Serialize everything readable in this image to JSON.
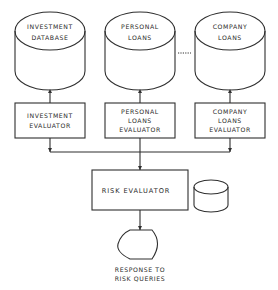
{
  "diagram": {
    "databases": [
      {
        "id": "investment-database",
        "lines": [
          "INVESTMENT",
          "DATABASE"
        ],
        "x": 15,
        "y": 12,
        "w": 70,
        "h": 78
      },
      {
        "id": "personal-loans",
        "lines": [
          "PERSONAL",
          "LOANS"
        ],
        "x": 105,
        "y": 12,
        "w": 70,
        "h": 78
      },
      {
        "id": "company-loans",
        "lines": [
          "COMPANY",
          "LOANS"
        ],
        "x": 195,
        "y": 12,
        "w": 70,
        "h": 78
      }
    ],
    "ellipsis_connector": "......",
    "evaluators": [
      {
        "id": "investment-evaluator",
        "lines": [
          "INVESTMENT",
          "EVALUATOR"
        ],
        "x": 15,
        "y": 103,
        "w": 70,
        "h": 35
      },
      {
        "id": "personal-loans-evaluator",
        "lines": [
          "PERSONAL",
          "LOANS",
          "EVALUATOR"
        ],
        "x": 105,
        "y": 103,
        "w": 70,
        "h": 35
      },
      {
        "id": "company-loans-evaluator",
        "lines": [
          "COMPANY",
          "LOANS",
          "EVALUATOR"
        ],
        "x": 195,
        "y": 103,
        "w": 70,
        "h": 35
      }
    ],
    "risk_evaluator": {
      "label": "RISK EVALUATOR",
      "x": 92,
      "y": 170,
      "w": 96,
      "h": 40
    },
    "side_store": {
      "x": 193,
      "y": 180,
      "w": 35,
      "h": 32
    },
    "output_display": {
      "lines": [
        "RESPONSE TO",
        "RISK QUERIES"
      ]
    },
    "colors": {
      "line": "#2f2f2f",
      "text": "#2a2a2a",
      "background": "#ffffff"
    }
  }
}
